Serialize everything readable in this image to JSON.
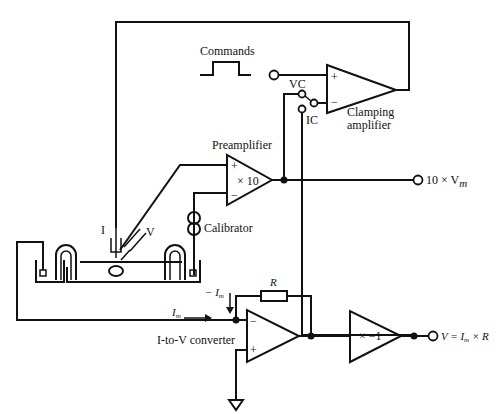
{
  "diagram": {
    "type": "circuit",
    "labels": {
      "commands": "Commands",
      "vc": "VC",
      "ic": "IC",
      "clamping_amplifier_line1": "Clamping",
      "clamping_amplifier_line2": "amplifier",
      "preamplifier": "Preamplifier",
      "preamp_gain": "× 10",
      "calibrator": "Calibrator",
      "electrode_i": "I",
      "electrode_v": "V",
      "preamp_output": "10 × V",
      "preamp_output_sub": "m",
      "feedback_resistor": "R",
      "minus_im": "− I",
      "minus_im_sub": "m",
      "im": "I",
      "im_sub": "m",
      "i_to_v_converter": "I-to-V converter",
      "inverter_gain": "× −1",
      "output_v": "V = I",
      "output_v_sub": "m",
      "output_v_tail": " × R",
      "plus": "+",
      "minus": "−"
    },
    "components": [
      {
        "id": "clamping-amplifier",
        "type": "op-amp"
      },
      {
        "id": "preamplifier",
        "type": "amplifier",
        "gain": "×10"
      },
      {
        "id": "calibrator",
        "type": "current-source"
      },
      {
        "id": "i-to-v-converter",
        "type": "op-amp",
        "feedback": "R"
      },
      {
        "id": "inverter",
        "type": "amplifier",
        "gain": "×−1"
      },
      {
        "id": "mode-switch",
        "type": "switch",
        "positions": [
          "VC",
          "IC"
        ]
      },
      {
        "id": "bath",
        "type": "recording-chamber"
      }
    ]
  }
}
